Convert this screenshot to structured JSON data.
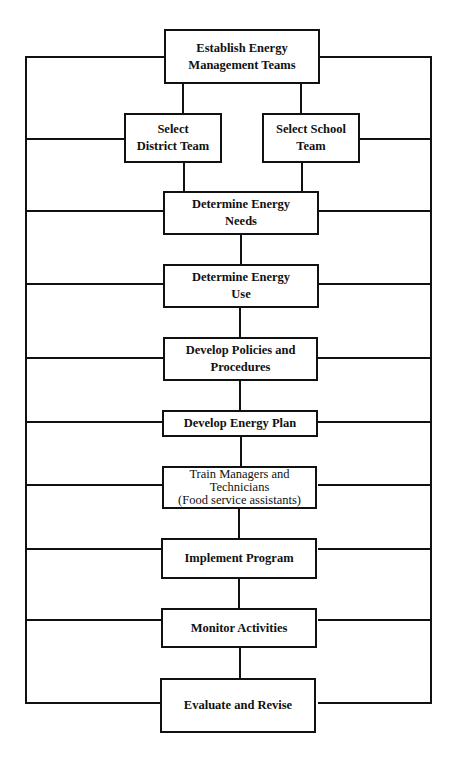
{
  "diagram": {
    "type": "flowchart",
    "stroke_color": "#111111",
    "background": "#ffffff",
    "nodes": [
      {
        "id": "establish",
        "lines": [
          "Establish Energy",
          "Management Teams"
        ]
      },
      {
        "id": "district",
        "lines": [
          "Select",
          "District Team"
        ]
      },
      {
        "id": "school",
        "lines": [
          "Select School",
          "Team"
        ]
      },
      {
        "id": "needs",
        "lines": [
          "Determine Energy",
          "Needs"
        ]
      },
      {
        "id": "use",
        "lines": [
          "Determine Energy",
          "Use"
        ]
      },
      {
        "id": "policies",
        "lines": [
          "Develop Policies and",
          "Procedures"
        ]
      },
      {
        "id": "plan",
        "lines": [
          "Develop Energy Plan"
        ]
      },
      {
        "id": "train",
        "lines": [
          "Train Managers and",
          "Technicians",
          "(Food service assistants)"
        ]
      },
      {
        "id": "implement",
        "lines": [
          "Implement Program"
        ]
      },
      {
        "id": "monitor",
        "lines": [
          "Monitor Activities"
        ]
      },
      {
        "id": "evaluate",
        "lines": [
          "Evaluate and Revise"
        ]
      }
    ],
    "edges": [
      [
        "establish",
        "district"
      ],
      [
        "establish",
        "school"
      ],
      [
        "district",
        "needs"
      ],
      [
        "school",
        "needs"
      ],
      [
        "needs",
        "use"
      ],
      [
        "use",
        "policies"
      ],
      [
        "policies",
        "plan"
      ],
      [
        "plan",
        "train"
      ],
      [
        "train",
        "implement"
      ],
      [
        "implement",
        "monitor"
      ],
      [
        "monitor",
        "evaluate"
      ]
    ],
    "feedback_loop": "All steps connect to outer left and right rails forming a continuous loop"
  }
}
